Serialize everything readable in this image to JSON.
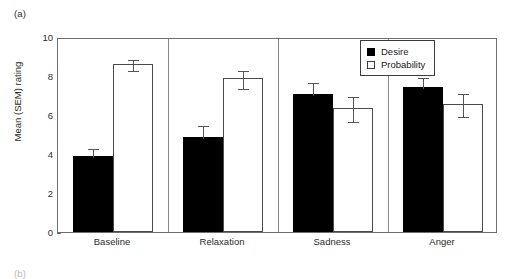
{
  "panel": {
    "label_a": "(a)",
    "label_b": "(b)"
  },
  "legend": {
    "position": "top-right",
    "entries": [
      {
        "label": "Desire",
        "swatch": "filled-square",
        "color": "#000000"
      },
      {
        "label": "Probability",
        "swatch": "open-square",
        "color": "#ffffff"
      }
    ]
  },
  "chart_data": {
    "type": "bar",
    "title": "",
    "xlabel": "",
    "ylabel": "Mean (SEM) rating",
    "ylim": [
      0,
      10
    ],
    "yticks": [
      0,
      2,
      4,
      6,
      8,
      10
    ],
    "ytick_labels": [
      "0",
      "2",
      "4",
      "6",
      "8",
      "10"
    ],
    "grid": false,
    "categories": [
      "Baseline",
      "Relaxation",
      "Sadness",
      "Anger"
    ],
    "series": [
      {
        "name": "Desire",
        "color": "#000000",
        "values": [
          3.92,
          4.85,
          7.1,
          7.42
        ],
        "errors": [
          0.42,
          0.68,
          0.66,
          0.58
        ],
        "error_caps": "upper"
      },
      {
        "name": "Probability",
        "color": "#ffffff",
        "values": [
          8.6,
          7.88,
          6.35,
          6.55
        ],
        "errors": [
          0.3,
          0.48,
          0.66,
          0.62
        ],
        "error_caps": "both"
      }
    ]
  }
}
